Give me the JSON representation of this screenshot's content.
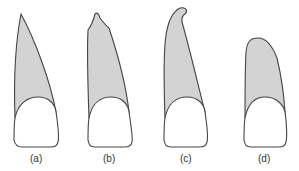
{
  "figure": {
    "panels": [
      {
        "id": "a",
        "label": "(a)"
      },
      {
        "id": "b",
        "label": "(b)"
      },
      {
        "id": "c",
        "label": "(c)"
      },
      {
        "id": "d",
        "label": "(d)"
      }
    ],
    "colors": {
      "root_fill": "#d3d3d3",
      "crown_fill": "#ffffff",
      "outline": "#444444"
    }
  }
}
